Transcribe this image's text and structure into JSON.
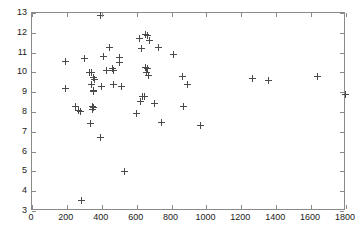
{
  "chart_data": {
    "type": "scatter",
    "title": "",
    "xlabel": "",
    "ylabel": "",
    "xlim": [
      0,
      1800
    ],
    "ylim": [
      3,
      13
    ],
    "xticks": [
      0,
      200,
      400,
      600,
      800,
      1000,
      1200,
      1400,
      1600,
      1800
    ],
    "yticks": [
      3,
      4,
      5,
      6,
      7,
      8,
      9,
      10,
      11,
      12,
      13
    ],
    "grid": false,
    "legend": null,
    "marker": "+",
    "marker_color": "#4a4a4a",
    "axis_color": "#8a8a8a",
    "background": "#ffffff",
    "series": [
      {
        "name": "data",
        "points": [
          [
            193,
            10.57
          ],
          [
            190,
            9.21
          ],
          [
            252,
            8.29
          ],
          [
            268,
            8.08
          ],
          [
            276,
            8.02
          ],
          [
            284,
            3.55
          ],
          [
            300,
            10.71
          ],
          [
            328,
            10.01
          ],
          [
            340,
            9.99
          ],
          [
            342,
            9.4
          ],
          [
            345,
            8.28
          ],
          [
            348,
            8.12
          ],
          [
            350,
            9.08
          ],
          [
            352,
            9.06
          ],
          [
            353,
            8.24
          ],
          [
            338,
            7.4
          ],
          [
            355,
            9.75
          ],
          [
            358,
            9.62
          ],
          [
            390,
            12.88
          ],
          [
            392,
            6.7
          ],
          [
            398,
            9.3
          ],
          [
            412,
            10.8
          ],
          [
            425,
            10.1
          ],
          [
            446,
            11.26
          ],
          [
            460,
            10.18
          ],
          [
            466,
            10.12
          ],
          [
            470,
            9.39
          ],
          [
            500,
            10.74
          ],
          [
            503,
            10.51
          ],
          [
            512,
            9.3
          ],
          [
            530,
            5.0
          ],
          [
            600,
            7.91
          ],
          [
            615,
            11.7
          ],
          [
            622,
            8.55
          ],
          [
            630,
            11.19
          ],
          [
            636,
            8.8
          ],
          [
            645,
            8.79
          ],
          [
            648,
            11.93
          ],
          [
            652,
            10.27
          ],
          [
            655,
            10.02
          ],
          [
            660,
            11.85
          ],
          [
            664,
            10.22
          ],
          [
            668,
            9.82
          ],
          [
            672,
            11.6
          ],
          [
            700,
            8.41
          ],
          [
            726,
            11.26
          ],
          [
            740,
            7.47
          ],
          [
            812,
            10.88
          ],
          [
            862,
            9.8
          ],
          [
            868,
            8.29
          ],
          [
            890,
            9.39
          ],
          [
            965,
            7.31
          ],
          [
            1262,
            9.7
          ],
          [
            1358,
            9.6
          ],
          [
            1638,
            9.78
          ],
          [
            1798,
            8.88
          ]
        ]
      }
    ]
  }
}
